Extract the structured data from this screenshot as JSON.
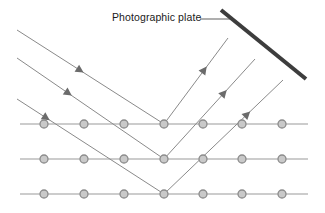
{
  "figure": {
    "title_label": "Photographic plate",
    "background_color": "#ffffff"
  },
  "labels": [
    {
      "name": "photographic-plate-label",
      "text": "Photographic plate",
      "x": 112,
      "y": 11,
      "font_size": 10.5,
      "color": "#1a1a1a"
    }
  ],
  "colors": {
    "plate": "#3d3d3d",
    "ray": "#8a8a8a",
    "lattice_line": "#9a9a9a",
    "atom_stroke": "#8c8c8c",
    "atom_fill": "#c9c9c9",
    "leader_line": "#6e6e6e",
    "arrow_head": "#6b6b6b",
    "text": "#1a1a1a"
  },
  "photographic_plate": {
    "name": "photographic-plate",
    "x1": 221,
    "y1": 10,
    "x2": 306,
    "y2": 79,
    "thickness": 4,
    "color": "#3d3d3d"
  },
  "leader_line": {
    "name": "plate-leader-line",
    "x1": 200,
    "y1": 19,
    "x2": 230,
    "y2": 19,
    "color": "#6e6e6e"
  },
  "lattice_rows": [
    {
      "name": "atom-row-top",
      "y": 124,
      "x_start": 20,
      "x_end": 308,
      "atom_x": [
        44,
        84,
        124,
        164,
        203,
        242,
        282
      ]
    },
    {
      "name": "atom-row-middle",
      "y": 159,
      "x_start": 20,
      "x_end": 308,
      "atom_x": [
        44,
        84,
        124,
        164,
        203,
        242,
        282
      ]
    },
    {
      "name": "atom-row-bottom",
      "y": 194,
      "x_start": 20,
      "x_end": 308,
      "atom_x": [
        44,
        84,
        124,
        164,
        203,
        242,
        282
      ]
    }
  ],
  "atom_radius": 4,
  "incident_rays": [
    {
      "name": "incident-ray-1",
      "x1": 17,
      "y1": 30,
      "x2": 164,
      "y2": 124,
      "arrow_t": 0.43
    },
    {
      "name": "incident-ray-2",
      "x1": 17,
      "y1": 58,
      "x2": 164,
      "y2": 159,
      "arrow_t": 0.35
    },
    {
      "name": "incident-ray-3",
      "x1": 17,
      "y1": 99,
      "x2": 164,
      "y2": 194,
      "arrow_t": 0.2
    }
  ],
  "reflected_rays": [
    {
      "name": "reflected-ray-1",
      "x1": 164,
      "y1": 124,
      "x2": 228,
      "y2": 38,
      "arrow_t": 0.63
    },
    {
      "name": "reflected-ray-2",
      "x1": 164,
      "y1": 159,
      "x2": 255,
      "y2": 59,
      "arrow_t": 0.66
    },
    {
      "name": "reflected-ray-3",
      "x1": 164,
      "y1": 194,
      "x2": 283,
      "y2": 80,
      "arrow_t": 0.7
    }
  ]
}
